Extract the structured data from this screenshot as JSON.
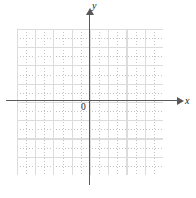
{
  "figure": {
    "width": 196,
    "height": 198,
    "background_color": "#ffffff"
  },
  "axes": {
    "x_label": "x",
    "y_label": "y",
    "origin_label": "0",
    "axis_color": "#595959",
    "label_color": "#1a1a1a",
    "x_arrow_icon": "arrow-right-icon",
    "y_arrow_icon": "arrow-up-icon"
  },
  "grid": {
    "minor_color": "#c4c4c4",
    "major_color": "#dcdcdc",
    "style": "dotted",
    "columns": 16,
    "rows": 16,
    "major_every": 2,
    "left": 17,
    "top": 29,
    "width": 146,
    "height": 146
  },
  "chart_data": {
    "type": "scatter",
    "title": "",
    "xlabel": "x",
    "ylabel": "y",
    "xlim": [
      -8,
      8
    ],
    "ylim": [
      -8,
      8
    ],
    "x": [],
    "y": [],
    "series": [],
    "grid": true,
    "legend": "none",
    "annotations": [
      "0"
    ]
  }
}
